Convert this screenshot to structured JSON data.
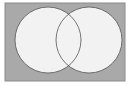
{
  "diagram": {
    "type": "venn",
    "universe": {
      "x": 5,
      "y": 3,
      "width": 120,
      "height": 78,
      "fill": "#a9a9a9",
      "stroke": "#8a8a8a"
    },
    "sets": [
      {
        "name": "A",
        "cx": 48,
        "cy": 40,
        "r": 33,
        "fill": "#f2f2f2",
        "stroke": "#555555"
      },
      {
        "name": "B",
        "cx": 89,
        "cy": 40,
        "r": 33,
        "fill": "#f2f2f2",
        "stroke": "#555555"
      }
    ]
  }
}
